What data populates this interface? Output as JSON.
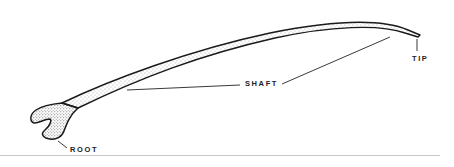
{
  "diagram": {
    "labels": {
      "shaft": "SHAFT",
      "tip": "TIP",
      "root": "ROOT"
    },
    "colors": {
      "outline": "#1a1a1a",
      "stipple": "#555555",
      "background": "#ffffff",
      "separator": "#c8c8c8"
    }
  }
}
